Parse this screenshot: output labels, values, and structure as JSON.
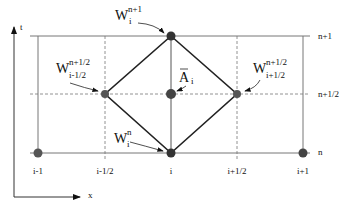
{
  "axes": {
    "t_label": "t",
    "x_label": "x"
  },
  "row_labels": [
    "n+1",
    "n+1/2",
    "n"
  ],
  "column_labels": [
    "i-1",
    "i-1/2",
    "i",
    "i+1/2",
    "i+1"
  ],
  "annotations": {
    "w_top": {
      "base": "W",
      "sub": "i",
      "sup": "n+1"
    },
    "w_left": {
      "base": "W",
      "sub": "i-1/2",
      "sup": "n+1/2"
    },
    "w_right": {
      "base": "W",
      "sub": "i+1/2",
      "sup": "n+1/2"
    },
    "w_bottom": {
      "base": "W",
      "sub": "i",
      "sup": "n"
    },
    "a_center": {
      "base": "A",
      "sub": "i",
      "overbar": true
    }
  },
  "colors": {
    "line": "#222222",
    "grid": "#777777",
    "node": "#444444"
  }
}
